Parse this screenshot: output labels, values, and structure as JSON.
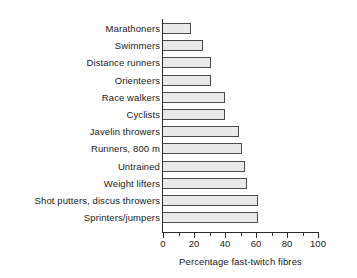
{
  "chart_data": {
    "type": "bar",
    "orientation": "horizontal",
    "title": "",
    "xlabel": "Percentage fast-twitch fibres",
    "ylabel": "",
    "xlim": [
      0,
      100
    ],
    "grid": false,
    "legend": null,
    "major_tick_step": 20,
    "minor_tick_step": 10,
    "tick_labels": [
      "0",
      "20",
      "40",
      "60",
      "80",
      "100"
    ],
    "tick_values": [
      0,
      20,
      40,
      60,
      80,
      100
    ],
    "categories": [
      "Marathoners",
      "Swimmers",
      "Distance runners",
      "Orienteers",
      "Race walkers",
      "Cyclists",
      "Javelin throwers",
      "Runners, 800 m",
      "Untrained",
      "Weight lifters",
      "Shot putters, discus throwers",
      "Sprinters/jumpers"
    ],
    "values": [
      18,
      26,
      31,
      31,
      40,
      40,
      49,
      51,
      53,
      54,
      61,
      61
    ],
    "bar_fill_color": "#e9e9e9",
    "bar_border_color": "#4a4a4a",
    "axis_color": "#2b2b2b"
  }
}
